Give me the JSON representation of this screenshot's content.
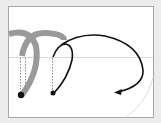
{
  "diagram": {
    "caption": "Curved path arc illustration",
    "colors": {
      "background": "#ececec",
      "panel": "#ffffff",
      "panel_border": "#a8a8a8",
      "baseline": "#d8d8d8",
      "ghost_arc": "#9a9a9a",
      "arc": "#111111",
      "guide": "#888888"
    },
    "elements": [
      {
        "name": "ghost-arc-1",
        "type": "thick-arc"
      },
      {
        "name": "ghost-arc-2",
        "type": "thick-arc"
      },
      {
        "name": "black-arc-arrow",
        "type": "arc-with-arrowhead"
      },
      {
        "name": "anchor-point-1",
        "type": "dot"
      },
      {
        "name": "anchor-point-2",
        "type": "dot"
      },
      {
        "name": "dotted-guide-lines",
        "type": "dotted-vertical"
      }
    ]
  }
}
